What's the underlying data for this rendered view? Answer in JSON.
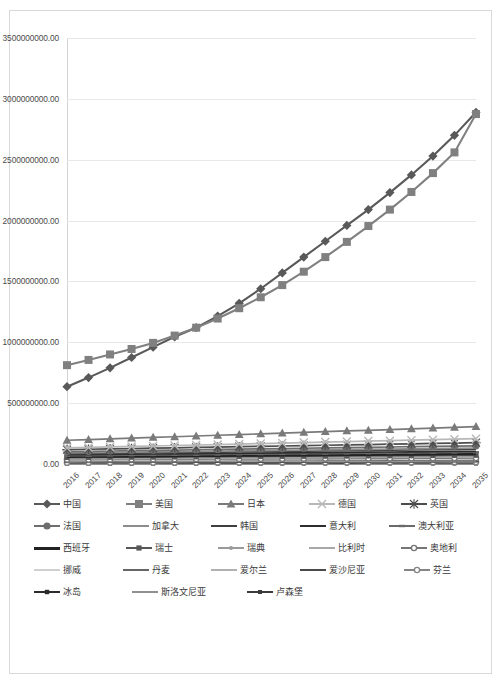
{
  "chart_data": {
    "type": "line",
    "title": "",
    "xlabel": "",
    "ylabel": "",
    "grid": true,
    "legend_position": "bottom",
    "ylim": [
      0,
      3500000000
    ],
    "ytick_labels": [
      "3500000000.00",
      "3000000000.00",
      "2500000000.00",
      "2000000000.00",
      "1500000000.00",
      "1000000000.00",
      "500000000.00",
      "0.00"
    ],
    "ytick_values": [
      3500000000,
      3000000000,
      2500000000,
      2000000000,
      1500000000,
      1000000000,
      500000000,
      0
    ],
    "categories": [
      "2016",
      "2017",
      "2018",
      "2019",
      "2020",
      "2021",
      "2022",
      "2023",
      "2024",
      "2025",
      "2026",
      "2027",
      "2028",
      "2029",
      "2030",
      "2031",
      "2032",
      "2033",
      "2034",
      "2035"
    ],
    "series": [
      {
        "name": "中国",
        "marker": "diamond",
        "color": "#595959",
        "values": [
          635000000,
          710000000,
          790000000,
          875000000,
          960000000,
          1045000000,
          1120000000,
          1215000000,
          1320000000,
          1440000000,
          1570000000,
          1700000000,
          1830000000,
          1960000000,
          2090000000,
          2230000000,
          2375000000,
          2530000000,
          2700000000,
          2890000000
        ]
      },
      {
        "name": "美国",
        "marker": "square",
        "color": "#808080",
        "values": [
          812000000,
          855000000,
          900000000,
          945000000,
          995000000,
          1055000000,
          1120000000,
          1195000000,
          1280000000,
          1370000000,
          1470000000,
          1580000000,
          1700000000,
          1825000000,
          1955000000,
          2090000000,
          2235000000,
          2390000000,
          2560000000,
          2875000000
        ]
      },
      {
        "name": "日本",
        "marker": "triangle",
        "color": "#7a7a7a",
        "values": [
          195000000,
          200000000,
          206000000,
          212000000,
          218000000,
          224000000,
          230000000,
          236000000,
          242000000,
          248000000,
          254000000,
          260000000,
          266000000,
          272000000,
          277000000,
          283000000,
          289000000,
          295000000,
          301000000,
          307000000
        ]
      },
      {
        "name": "德国",
        "marker": "cross",
        "color": "#b8b8b8",
        "values": [
          132000000,
          136000000,
          140000000,
          144000000,
          148000000,
          152000000,
          156000000,
          160000000,
          164000000,
          168000000,
          172000000,
          176000000,
          180000000,
          184000000,
          188000000,
          192000000,
          196000000,
          200000000,
          204000000,
          208000000
        ]
      },
      {
        "name": "英国",
        "marker": "asterisk",
        "color": "#4d4d4d",
        "values": [
          118000000,
          121000000,
          124000000,
          127000000,
          130000000,
          133000000,
          136000000,
          139000000,
          142000000,
          145000000,
          148000000,
          151000000,
          154000000,
          157000000,
          160000000,
          163000000,
          166000000,
          169000000,
          172000000,
          175000000
        ]
      },
      {
        "name": "法国",
        "marker": "circle",
        "color": "#6e6e6e",
        "values": [
          102000000,
          104500000,
          107000000,
          109500000,
          112000000,
          114500000,
          117000000,
          119500000,
          122000000,
          124500000,
          127000000,
          129500000,
          132000000,
          134500000,
          137000000,
          139500000,
          142000000,
          144500000,
          147000000,
          149500000
        ]
      },
      {
        "name": "加拿大",
        "marker": "none",
        "color": "#8c8c8c",
        "values": [
          92000000,
          94000000,
          96000000,
          98000000,
          100000000,
          102000000,
          104000000,
          106000000,
          108000000,
          110000000,
          112000000,
          114000000,
          116000000,
          118000000,
          120000000,
          122000000,
          124000000,
          126000000,
          128000000,
          130000000
        ]
      },
      {
        "name": "韩国",
        "marker": "none",
        "color": "#3f3f3f",
        "values": [
          84000000,
          86000000,
          88000000,
          90000000,
          92000000,
          94000000,
          96000000,
          98000000,
          100000000,
          102000000,
          104000000,
          106000000,
          108000000,
          110000000,
          112000000,
          114000000,
          116000000,
          118000000,
          120000000,
          122000000
        ]
      },
      {
        "name": "意大利",
        "marker": "none",
        "color": "#2e2e2e",
        "values": [
          76000000,
          77500000,
          79000000,
          80500000,
          82000000,
          83500000,
          85000000,
          86500000,
          88000000,
          89500000,
          91000000,
          92500000,
          94000000,
          95500000,
          97000000,
          98500000,
          100000000,
          101500000,
          103000000,
          104500000
        ]
      },
      {
        "name": "澳大利亚",
        "marker": "dash",
        "color": "#6a6a6a",
        "values": [
          68000000,
          69500000,
          71000000,
          72500000,
          74000000,
          75500000,
          77000000,
          78500000,
          80000000,
          81500000,
          83000000,
          84500000,
          86000000,
          87500000,
          89000000,
          90500000,
          92000000,
          93500000,
          95000000,
          96500000
        ]
      },
      {
        "name": "西班牙",
        "marker": "thick",
        "color": "#222222",
        "values": [
          60000000,
          61200000,
          62400000,
          63600000,
          64800000,
          66000000,
          67200000,
          68400000,
          69600000,
          70800000,
          72000000,
          73200000,
          74400000,
          75600000,
          76800000,
          78000000,
          79200000,
          80400000,
          81600000,
          82800000
        ]
      },
      {
        "name": "瑞士",
        "marker": "square-sm",
        "color": "#575757",
        "values": [
          54000000,
          55000000,
          56000000,
          57000000,
          58000000,
          59000000,
          60000000,
          61000000,
          62000000,
          63000000,
          64000000,
          65000000,
          66000000,
          67000000,
          68000000,
          69000000,
          70000000,
          71000000,
          72000000,
          73000000
        ]
      },
      {
        "name": "瑞典",
        "marker": "dot",
        "color": "#9a9a9a",
        "values": [
          48000000,
          48900000,
          49800000,
          50700000,
          51600000,
          52500000,
          53400000,
          54300000,
          55200000,
          56100000,
          57000000,
          57900000,
          58800000,
          59700000,
          60600000,
          61500000,
          62400000,
          63300000,
          64200000,
          65100000
        ]
      },
      {
        "name": "比利时",
        "marker": "none",
        "color": "#a8a8a8",
        "values": [
          42000000,
          42800000,
          43600000,
          44400000,
          45200000,
          46000000,
          46800000,
          47600000,
          48400000,
          49200000,
          50000000,
          50800000,
          51600000,
          52400000,
          53200000,
          54000000,
          54800000,
          55600000,
          56400000,
          57200000
        ]
      },
      {
        "name": "奥地利",
        "marker": "circle-sm",
        "color": "#767676",
        "values": [
          36000000,
          36700000,
          37400000,
          38100000,
          38800000,
          39500000,
          40200000,
          40900000,
          41600000,
          42300000,
          43000000,
          43700000,
          44400000,
          45100000,
          45800000,
          46500000,
          47200000,
          47900000,
          48600000,
          49300000
        ]
      },
      {
        "name": "挪威",
        "marker": "none",
        "color": "#d0d0d0",
        "values": [
          30000000,
          30600000,
          31200000,
          31800000,
          32400000,
          33000000,
          33600000,
          34200000,
          34800000,
          35400000,
          36000000,
          36600000,
          37200000,
          37800000,
          38400000,
          39000000,
          39600000,
          40200000,
          40800000,
          41400000
        ]
      },
      {
        "name": "丹麦",
        "marker": "none",
        "color": "#666666",
        "values": [
          25000000,
          25500000,
          26000000,
          26500000,
          27000000,
          27500000,
          28000000,
          28500000,
          29000000,
          29500000,
          30000000,
          30500000,
          31000000,
          31500000,
          32000000,
          32500000,
          33000000,
          33500000,
          34000000,
          34500000
        ]
      },
      {
        "name": "爱尔兰",
        "marker": "none",
        "color": "#b0b0b0",
        "values": [
          20000000,
          20400000,
          20800000,
          21200000,
          21600000,
          22000000,
          22400000,
          22800000,
          23200000,
          23600000,
          24000000,
          24400000,
          24800000,
          25200000,
          25600000,
          26000000,
          26400000,
          26800000,
          27200000,
          27600000
        ]
      },
      {
        "name": "爱沙尼亚",
        "marker": "dash2",
        "color": "#4a4a4a",
        "values": [
          15000000,
          15300000,
          15600000,
          15900000,
          16200000,
          16500000,
          16800000,
          17100000,
          17400000,
          17700000,
          18000000,
          18300000,
          18600000,
          18900000,
          19200000,
          19500000,
          19800000,
          20100000,
          20400000,
          20700000
        ]
      },
      {
        "name": "芬兰",
        "marker": "circle-sm",
        "color": "#858585",
        "values": [
          11000000,
          11250000,
          11500000,
          11750000,
          12000000,
          12250000,
          12500000,
          12750000,
          13000000,
          13250000,
          13500000,
          13750000,
          14000000,
          14250000,
          14500000,
          14750000,
          15000000,
          15250000,
          15500000,
          15750000
        ]
      },
      {
        "name": "冰岛",
        "marker": "sq2",
        "color": "#2b2b2b",
        "values": [
          8000000,
          8150000,
          8300000,
          8450000,
          8600000,
          8750000,
          8900000,
          9050000,
          9200000,
          9350000,
          9500000,
          9650000,
          9800000,
          9950000,
          10100000,
          10250000,
          10400000,
          10550000,
          10700000,
          10850000
        ]
      },
      {
        "name": "斯洛文尼亚",
        "marker": "dash3",
        "color": "#909090",
        "values": [
          5000000,
          5100000,
          5200000,
          5300000,
          5400000,
          5500000,
          5600000,
          5700000,
          5800000,
          5900000,
          6000000,
          6100000,
          6200000,
          6300000,
          6400000,
          6500000,
          6600000,
          6700000,
          6800000,
          6900000
        ]
      },
      {
        "name": "卢森堡",
        "marker": "sq3",
        "color": "#3a3a3a",
        "values": [
          2500000,
          2560000,
          2620000,
          2680000,
          2740000,
          2800000,
          2860000,
          2920000,
          2980000,
          3040000,
          3100000,
          3160000,
          3220000,
          3280000,
          3340000,
          3400000,
          3460000,
          3520000,
          3580000,
          3640000
        ]
      }
    ]
  },
  "legend": {
    "rows": [
      [
        {
          "label": "中国",
          "series_index": 0
        },
        {
          "label": "美国",
          "series_index": 1
        },
        {
          "label": "日本",
          "series_index": 2
        },
        {
          "label": "德国",
          "series_index": 3
        },
        {
          "label": "英国",
          "series_index": 4
        }
      ],
      [
        {
          "label": "法国",
          "series_index": 5
        },
        {
          "label": "加拿大",
          "series_index": 6
        },
        {
          "label": "韩国",
          "series_index": 7
        },
        {
          "label": "意大利",
          "series_index": 8
        },
        {
          "label": "澳大利亚",
          "series_index": 9
        }
      ],
      [
        {
          "label": "西班牙",
          "series_index": 10
        },
        {
          "label": "瑞士",
          "series_index": 11
        },
        {
          "label": "瑞典",
          "series_index": 12
        },
        {
          "label": "比利时",
          "series_index": 13
        },
        {
          "label": "奥地利",
          "series_index": 14
        }
      ],
      [
        {
          "label": "挪威",
          "series_index": 15
        },
        {
          "label": "丹麦",
          "series_index": 16
        },
        {
          "label": "爱尔兰",
          "series_index": 17
        },
        {
          "label": "爱沙尼亚",
          "series_index": 18
        },
        {
          "label": "芬兰",
          "series_index": 19
        }
      ],
      [
        {
          "label": "冰岛",
          "series_index": 20
        },
        {
          "label": "斯洛文尼亚",
          "series_index": 21
        },
        {
          "label": "卢森堡",
          "series_index": 22
        }
      ]
    ]
  }
}
